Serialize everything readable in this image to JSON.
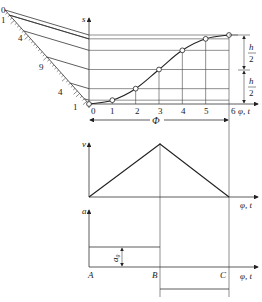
{
  "diagram": {
    "displacement_plot": {
      "y_axis_label": "s",
      "x_axis_label": "φ, t",
      "x_ticks": [
        "0",
        "1",
        "2",
        "3",
        "4",
        "5",
        "6"
      ],
      "span_label": "Φ",
      "half_stroke_label_num": "h",
      "half_stroke_label_den": "2",
      "construction_ticks": [
        "0",
        "1",
        "4",
        "9",
        "4",
        "1"
      ],
      "curve_points_fraction": [
        0,
        0.0556,
        0.2222,
        0.5,
        0.7778,
        0.9444,
        1.0
      ]
    },
    "velocity_plot": {
      "y_axis_label": "v",
      "x_axis_label": "φ, t"
    },
    "acceleration_plot": {
      "y_axis_label": "a",
      "x_axis_label": "φ, t",
      "points": [
        "A",
        "B",
        "C"
      ],
      "magnitude_label": "a₀"
    }
  }
}
